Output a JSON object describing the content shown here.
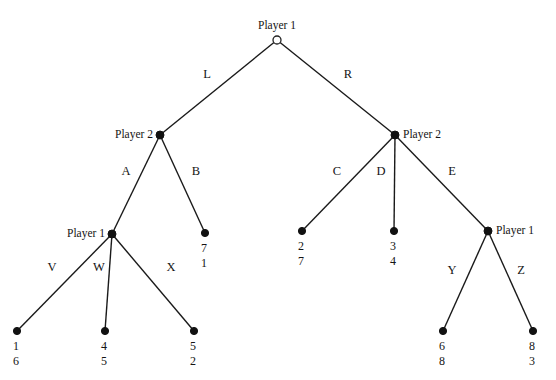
{
  "diagram": {
    "type": "extensive-form-game-tree",
    "title": "",
    "nodes": [
      {
        "id": "root",
        "player": "Player 1",
        "shape": "open-circle",
        "x": 277,
        "y": 40,
        "label_side": "top"
      },
      {
        "id": "p2left",
        "player": "Player 2",
        "shape": "filled-circle",
        "x": 160,
        "y": 135,
        "label_side": "left"
      },
      {
        "id": "p2right",
        "player": "Player 2",
        "shape": "filled-circle",
        "x": 395,
        "y": 135,
        "label_side": "right"
      },
      {
        "id": "p1left",
        "player": "Player 1",
        "shape": "filled-circle",
        "x": 112,
        "y": 234,
        "label_side": "left"
      },
      {
        "id": "p1right",
        "player": "Player 1",
        "shape": "filled-circle",
        "x": 488,
        "y": 231,
        "label_side": "right"
      }
    ],
    "terminals": [
      {
        "id": "t_V",
        "x": 17,
        "y": 331,
        "payoff_top": "1",
        "payoff_bottom": "6"
      },
      {
        "id": "t_W",
        "x": 105,
        "y": 331,
        "payoff_top": "4",
        "payoff_bottom": "5"
      },
      {
        "id": "t_X",
        "x": 194,
        "y": 331,
        "payoff_top": "5",
        "payoff_bottom": "2"
      },
      {
        "id": "t_B",
        "x": 205,
        "y": 233,
        "payoff_top": "7",
        "payoff_bottom": "1"
      },
      {
        "id": "t_C",
        "x": 302,
        "y": 231,
        "payoff_top": "2",
        "payoff_bottom": "7"
      },
      {
        "id": "t_D",
        "x": 394,
        "y": 231,
        "payoff_top": "3",
        "payoff_bottom": "4"
      },
      {
        "id": "t_Y",
        "x": 443,
        "y": 331,
        "payoff_top": "6",
        "payoff_bottom": "8"
      },
      {
        "id": "t_Z",
        "x": 533,
        "y": 331,
        "payoff_top": "8",
        "payoff_bottom": "3"
      }
    ],
    "edges": [
      {
        "id": "e_L",
        "from": "root",
        "to": "p2left",
        "label": "L",
        "lx": 207,
        "ly": 75
      },
      {
        "id": "e_R",
        "from": "root",
        "to": "p2right",
        "label": "R",
        "lx": 348,
        "ly": 75
      },
      {
        "id": "e_A",
        "from": "p2left",
        "to": "p1left",
        "label": "A",
        "lx": 126,
        "ly": 172
      },
      {
        "id": "e_B",
        "from": "p2left",
        "to": "t_B",
        "label": "B",
        "lx": 196,
        "ly": 172
      },
      {
        "id": "e_C",
        "from": "p2right",
        "to": "t_C",
        "label": "C",
        "lx": 337,
        "ly": 172
      },
      {
        "id": "e_D",
        "from": "p2right",
        "to": "t_D",
        "label": "D",
        "lx": 381,
        "ly": 172
      },
      {
        "id": "e_E",
        "from": "p2right",
        "to": "p1right",
        "label": "E",
        "lx": 452,
        "ly": 172
      },
      {
        "id": "e_V",
        "from": "p1left",
        "to": "t_V",
        "label": "V",
        "lx": 52,
        "ly": 268
      },
      {
        "id": "e_W",
        "from": "p1left",
        "to": "t_W",
        "label": "W",
        "lx": 99,
        "ly": 268
      },
      {
        "id": "e_X",
        "from": "p1left",
        "to": "t_X",
        "label": "X",
        "lx": 171,
        "ly": 268
      },
      {
        "id": "e_Y",
        "from": "p1right",
        "to": "t_Y",
        "label": "Y",
        "lx": 452,
        "ly": 271
      },
      {
        "id": "e_Z",
        "from": "p1right",
        "to": "t_Z",
        "label": "Z",
        "lx": 521,
        "ly": 271
      }
    ],
    "player_labels": [
      {
        "id": "pl_root",
        "text": "Player 1",
        "x": 277,
        "y": 27,
        "anchor": "center"
      },
      {
        "id": "pl_p2left",
        "text": "Player 2",
        "x": 153,
        "y": 136,
        "anchor": "right"
      },
      {
        "id": "pl_p2right",
        "text": "Player 2",
        "x": 403,
        "y": 136,
        "anchor": "left"
      },
      {
        "id": "pl_p1left",
        "text": "Player 1",
        "x": 105,
        "y": 235,
        "anchor": "right"
      },
      {
        "id": "pl_p1right",
        "text": "Player 1",
        "x": 496,
        "y": 232,
        "anchor": "left"
      }
    ],
    "colors": {
      "background": "#ffffff",
      "line": "#1a1a1a",
      "node_fill": "#111111",
      "text": "#141414"
    }
  }
}
